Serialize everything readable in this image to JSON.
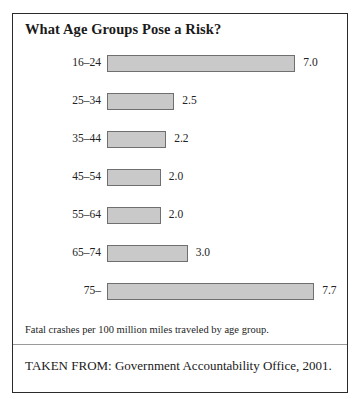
{
  "figure": {
    "title": "What Age Groups Pose a Risk?",
    "footnote": "Fatal crashes per 100 million miles traveled by age group.",
    "source": "TAKEN FROM: Government Accountability Office, 2001."
  },
  "style": {
    "bar_fill": "#c9c9c9",
    "bar_stroke": "#6f6f6f",
    "frame_border": "#2b2b2b",
    "text": "#1a1a1a"
  },
  "chart_data": {
    "type": "bar",
    "orientation": "horizontal",
    "title": "What Age Groups Pose a Risk?",
    "xlabel": "Fatal crashes per 100 million miles traveled",
    "ylabel": "Age group",
    "categories": [
      "16–24",
      "25–34",
      "35–44",
      "45–54",
      "55–64",
      "65–74",
      "75–"
    ],
    "values": [
      7.0,
      2.5,
      2.2,
      2.0,
      2.0,
      3.0,
      7.7
    ],
    "value_labels": [
      "7.0",
      "2.5",
      "2.2",
      "2.0",
      "2.0",
      "3.0",
      "7.7"
    ],
    "xlim": [
      0,
      7.7
    ],
    "grid": false,
    "legend": false,
    "annotations": [
      "Fatal crashes per 100 million miles traveled by age group.",
      "TAKEN FROM: Government Accountability Office, 2001."
    ]
  }
}
